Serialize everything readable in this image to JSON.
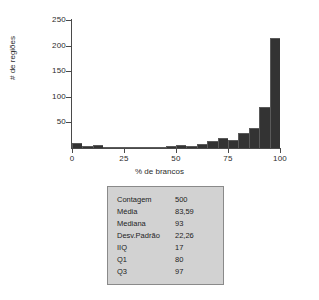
{
  "chart_data": {
    "type": "bar",
    "title": "",
    "subtitle": "",
    "xlabel": "% de brancos",
    "ylabel": "# de regiões",
    "xlim": [
      0,
      100
    ],
    "ylim": [
      0,
      250
    ],
    "grid": false,
    "legend": null,
    "bin_width": 5,
    "x_ticks": [
      "0",
      "25",
      "50",
      "75",
      "100"
    ],
    "x_tick_values": [
      0,
      25,
      50,
      75,
      100
    ],
    "y_ticks": [
      "50",
      "100",
      "150",
      "200",
      "250"
    ],
    "y_tick_values": [
      50,
      100,
      150,
      200,
      250
    ],
    "categories": [
      "0-5",
      "5-10",
      "10-15",
      "15-20",
      "20-25",
      "25-30",
      "30-35",
      "35-40",
      "40-45",
      "45-50",
      "50-55",
      "55-60",
      "60-65",
      "65-70",
      "70-75",
      "75-80",
      "80-85",
      "85-90",
      "90-95",
      "95-100"
    ],
    "bin_starts": [
      0,
      5,
      10,
      15,
      20,
      25,
      30,
      35,
      40,
      45,
      50,
      55,
      60,
      65,
      70,
      75,
      80,
      85,
      90,
      95
    ],
    "values": [
      10,
      4,
      5,
      2,
      2,
      2,
      2,
      2,
      2,
      3,
      5,
      4,
      8,
      13,
      20,
      16,
      30,
      39,
      81,
      215
    ]
  },
  "axes": {
    "y_title": "# de regiões",
    "x_title": "% de brancos"
  },
  "stats_table": {
    "rows": [
      {
        "label": "Contagem",
        "value": "500"
      },
      {
        "label": "Média",
        "value": "83,59"
      },
      {
        "label": "Mediana",
        "value": "93"
      },
      {
        "label": "Desv.Padrão",
        "value": "22,26"
      },
      {
        "label": "IIQ",
        "value": "17"
      },
      {
        "label": "Q1",
        "value": "80"
      },
      {
        "label": "Q3",
        "value": "97"
      }
    ]
  },
  "colors": {
    "bar_fill": "#333333",
    "axis": "#4a4a4a",
    "table_background": "#d2d2d2",
    "table_border": "#8a8a8a",
    "page_background": "#ffffff"
  }
}
